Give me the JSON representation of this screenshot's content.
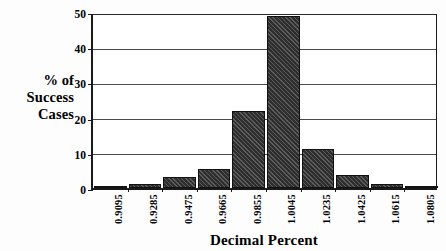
{
  "chart_data": {
    "type": "bar",
    "title": "",
    "xlabel": "Decimal Percent",
    "ylabel": "% of Success Cases",
    "ylabel_lines": [
      "% of",
      "Success",
      "Cases"
    ],
    "categories": [
      "0.9095",
      "0.9285",
      "0.9475",
      "0.9665",
      "0.9855",
      "1.0045",
      "1.0235",
      "1.0425",
      "1.0615",
      "1.0805"
    ],
    "values": [
      0.6,
      1.2,
      3.0,
      5.5,
      22.0,
      49.0,
      11.0,
      3.6,
      1.0,
      0.2
    ],
    "ylim": [
      0,
      50
    ],
    "yticks": [
      0,
      10,
      20,
      30,
      40,
      50
    ],
    "ytick_labels": [
      "0",
      "10",
      "20",
      "30",
      "40",
      "50"
    ],
    "grid": true,
    "grid_axis": "y",
    "legend": "none",
    "bar_color": "#2e2e2e",
    "bar_fill_pattern": "diagonal-hatch",
    "axis_color": "#1a1a1a",
    "background_color": "#ffffff"
  },
  "axes": {
    "x_title": "Decimal Percent",
    "y_title_line1": "% of",
    "y_title_line2": "Success",
    "y_title_line3": "Cases"
  }
}
